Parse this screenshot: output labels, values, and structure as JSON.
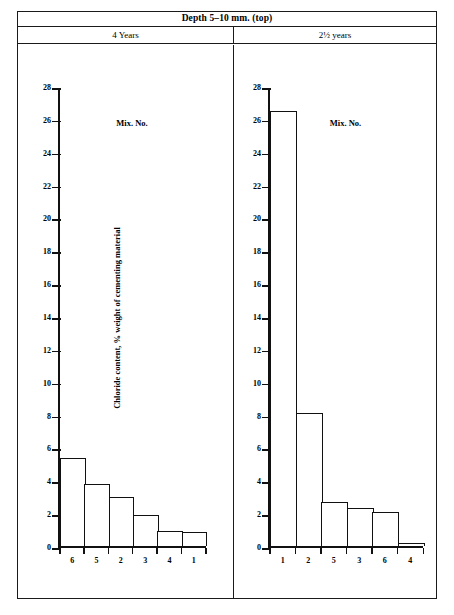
{
  "figure": {
    "title": "Depth 5–10 mm. (top)",
    "panels": [
      {
        "subtitle": "4 Years"
      },
      {
        "subtitle": "2½ years"
      }
    ]
  },
  "axes": {
    "ylabel": "Chloride content, % weight of cementing material",
    "xlabel": "Mix. No.",
    "yticks": [
      "0",
      "2",
      "4",
      "6",
      "8",
      "10",
      "12",
      "14",
      "16",
      "18",
      "20",
      "22",
      "24",
      "26",
      "28"
    ]
  },
  "chart_data": [
    {
      "type": "bar",
      "title": "4 Years",
      "panel_title": "Depth 5–10 mm. (top)",
      "categories": [
        "6",
        "5",
        "2",
        "3",
        "4",
        "1"
      ],
      "values": [
        5.4,
        3.8,
        3.0,
        1.9,
        0.9,
        0.85
      ],
      "xlabel": "Mix. No.",
      "ylabel": "Chloride content, % weight of cementing material",
      "ylim": [
        0,
        28
      ],
      "ytick_step": 2,
      "grid": false,
      "legend": false
    },
    {
      "type": "bar",
      "title": "2½ years",
      "panel_title": "Depth 5–10 mm. (top)",
      "categories": [
        "1",
        "2",
        "5",
        "3",
        "6",
        "4"
      ],
      "values": [
        26.6,
        8.15,
        2.7,
        2.35,
        2.05,
        0.2
      ],
      "xlabel": "Mix. No.",
      "ylabel": "Chloride content, % weight of cementing material",
      "ylim": [
        0,
        28
      ],
      "ytick_step": 2,
      "grid": false,
      "legend": false
    }
  ],
  "style": {
    "line_color": "#111111",
    "bar_fill": "#ffffff",
    "background": "#ffffff"
  }
}
